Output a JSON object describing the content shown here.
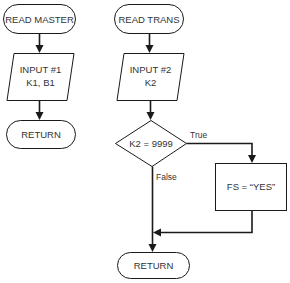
{
  "diagram": {
    "type": "flowchart",
    "colors": {
      "stroke": "#1a1a1a",
      "text": "#333333",
      "background": "#ffffff"
    },
    "left_flow": {
      "start": {
        "shape": "terminal",
        "label": "READ MASTER"
      },
      "input": {
        "shape": "parallelogram",
        "line1": "INPUT #1",
        "line2": "K1, B1"
      },
      "end": {
        "shape": "terminal",
        "label": "RETURN"
      }
    },
    "right_flow": {
      "start": {
        "shape": "terminal",
        "label": "READ TRANS"
      },
      "input": {
        "shape": "parallelogram",
        "line1": "INPUT #2",
        "line2": "K2"
      },
      "decision": {
        "shape": "diamond",
        "label": "K2 = 9999",
        "true_label": "True",
        "false_label": "False"
      },
      "process": {
        "shape": "rectangle",
        "label": "FS = “YES”"
      },
      "end": {
        "shape": "terminal",
        "label": "RETURN"
      }
    }
  }
}
